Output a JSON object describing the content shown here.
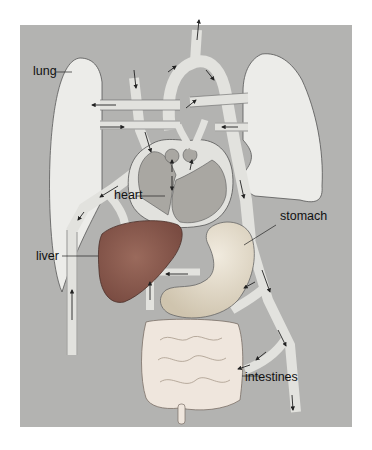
{
  "diagram": {
    "type": "anatomical-circulation-diagram",
    "labels": {
      "lung": "lung",
      "heart": "heart",
      "liver": "liver",
      "stomach": "stomach",
      "intestines": "intestines"
    },
    "colors": {
      "background": "#b3b3b1",
      "lung": "#ececea",
      "vessel": "#e2e2de",
      "heart_chamber": "#a9a7a2",
      "liver": "#8f5f52",
      "stomach": "#e4dccb",
      "intestines": "#efe6dd",
      "arrow": "#222222"
    }
  }
}
